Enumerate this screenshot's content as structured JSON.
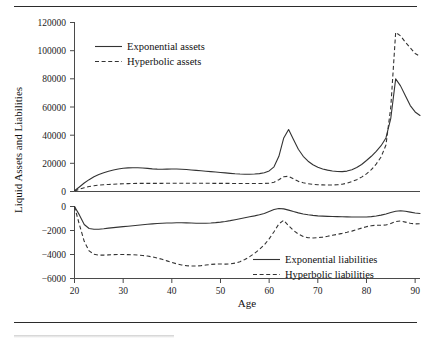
{
  "figure": {
    "has_top_rule": true,
    "has_bottom_rule": true,
    "background_color": "#ffffff",
    "line_color": "#333333"
  },
  "chart_data": {
    "type": "line",
    "title": "",
    "subtitle": "",
    "xlabel": "Age",
    "ylabel": "Liquid Assets and Liabilities",
    "grid": false,
    "panels": [
      {
        "name": "assets-panel",
        "ylim": [
          0,
          120000
        ],
        "yticks": [
          0,
          20000,
          40000,
          60000,
          80000,
          100000,
          120000
        ],
        "ytick_labels": [
          "0",
          "20000",
          "40000",
          "60000",
          "80000",
          "100000",
          "120000"
        ],
        "legend_position": "upper-left",
        "series": [
          {
            "name": "Exponential assets",
            "style": "solid",
            "x": [
              20,
              21,
              22,
              23,
              24,
              25,
              26,
              27,
              28,
              29,
              30,
              31,
              32,
              33,
              34,
              35,
              36,
              37,
              38,
              39,
              40,
              41,
              42,
              43,
              44,
              45,
              46,
              47,
              48,
              49,
              50,
              51,
              52,
              53,
              54,
              55,
              56,
              57,
              58,
              59,
              60,
              61,
              62,
              63,
              64,
              65,
              66,
              67,
              68,
              69,
              70,
              71,
              72,
              73,
              74,
              75,
              76,
              77,
              78,
              79,
              80,
              81,
              82,
              83,
              84,
              85,
              86,
              87,
              88,
              89,
              90,
              91
            ],
            "values": [
              500,
              3200,
              6000,
              8400,
              10400,
              12000,
              13300,
              14400,
              15300,
              16000,
              16500,
              16800,
              16900,
              16850,
              16700,
              16400,
              16100,
              15900,
              15800,
              15900,
              16000,
              15950,
              15800,
              15600,
              15300,
              15000,
              14700,
              14400,
              14100,
              13800,
              13500,
              13200,
              12900,
              12600,
              12400,
              12300,
              12300,
              12400,
              12700,
              13300,
              14600,
              17500,
              25000,
              38000,
              44000,
              37000,
              30000,
              25000,
              21500,
              19000,
              17200,
              16000,
              15200,
              14600,
              14200,
              14100,
              14500,
              15400,
              17000,
              19200,
              22000,
              25000,
              28500,
              32500,
              38000,
              52000,
              80000,
              75000,
              68000,
              61000,
              56500,
              54000
            ]
          },
          {
            "name": "Hyperbolic assets",
            "style": "dashed",
            "x": [
              20,
              21,
              22,
              23,
              24,
              25,
              26,
              27,
              28,
              29,
              30,
              31,
              32,
              33,
              34,
              35,
              36,
              37,
              38,
              39,
              40,
              41,
              42,
              43,
              44,
              45,
              46,
              47,
              48,
              49,
              50,
              51,
              52,
              53,
              54,
              55,
              56,
              57,
              58,
              59,
              60,
              61,
              62,
              63,
              64,
              65,
              66,
              67,
              68,
              69,
              70,
              71,
              72,
              73,
              74,
              75,
              76,
              77,
              78,
              79,
              80,
              81,
              82,
              83,
              84,
              85,
              86,
              87,
              88,
              89,
              90,
              91
            ],
            "values": [
              400,
              1600,
              2700,
              3500,
              4100,
              4500,
              4800,
              5000,
              5200,
              5350,
              5500,
              5600,
              5700,
              5750,
              5800,
              5800,
              5800,
              5800,
              5800,
              5850,
              5900,
              5900,
              5900,
              5900,
              5900,
              5900,
              5900,
              5850,
              5800,
              5800,
              5800,
              5800,
              5750,
              5700,
              5700,
              5700,
              5700,
              5700,
              5700,
              5750,
              5900,
              6600,
              8400,
              10500,
              10800,
              9000,
              7200,
              6200,
              5500,
              5100,
              4800,
              4700,
              4600,
              4600,
              4800,
              5200,
              5900,
              7000,
              8400,
              10200,
              12500,
              15500,
              19500,
              24500,
              33000,
              60000,
              113000,
              110500,
              106000,
              102000,
              98000,
              96000
            ]
          }
        ]
      },
      {
        "name": "liabilities-panel",
        "ylim": [
          -6000,
          0
        ],
        "yticks": [
          -6000,
          -4000,
          -2000,
          0
        ],
        "ytick_labels": [
          "−6000",
          "−4000",
          "−2000",
          "0"
        ],
        "legend_position": "lower-right",
        "series": [
          {
            "name": "Exponential liabilities",
            "style": "solid",
            "x": [
              20,
              21,
              22,
              23,
              24,
              25,
              26,
              27,
              28,
              29,
              30,
              31,
              32,
              33,
              34,
              35,
              36,
              37,
              38,
              39,
              40,
              41,
              42,
              43,
              44,
              45,
              46,
              47,
              48,
              49,
              50,
              51,
              52,
              53,
              54,
              55,
              56,
              57,
              58,
              59,
              60,
              61,
              62,
              63,
              64,
              65,
              66,
              67,
              68,
              69,
              70,
              71,
              72,
              73,
              74,
              75,
              76,
              77,
              78,
              79,
              80,
              81,
              82,
              83,
              84,
              85,
              86,
              87,
              88,
              89,
              90,
              91
            ],
            "values": [
              0,
              -700,
              -1500,
              -1830,
              -1900,
              -1890,
              -1850,
              -1800,
              -1760,
              -1720,
              -1680,
              -1640,
              -1600,
              -1560,
              -1520,
              -1480,
              -1450,
              -1420,
              -1400,
              -1380,
              -1370,
              -1360,
              -1360,
              -1365,
              -1375,
              -1390,
              -1400,
              -1390,
              -1370,
              -1340,
              -1300,
              -1250,
              -1180,
              -1100,
              -1020,
              -940,
              -860,
              -780,
              -690,
              -580,
              -420,
              -250,
              -170,
              -200,
              -300,
              -420,
              -530,
              -620,
              -690,
              -740,
              -780,
              -800,
              -820,
              -835,
              -845,
              -855,
              -865,
              -875,
              -880,
              -880,
              -870,
              -840,
              -790,
              -720,
              -620,
              -500,
              -390,
              -350,
              -400,
              -470,
              -540,
              -580
            ]
          },
          {
            "name": "Hyperbolic liabilities",
            "style": "dashed",
            "x": [
              20,
              21,
              22,
              23,
              24,
              25,
              26,
              27,
              28,
              29,
              30,
              31,
              32,
              33,
              34,
              35,
              36,
              37,
              38,
              39,
              40,
              41,
              42,
              43,
              44,
              45,
              46,
              47,
              48,
              49,
              50,
              51,
              52,
              53,
              54,
              55,
              56,
              57,
              58,
              59,
              60,
              61,
              62,
              63,
              64,
              65,
              66,
              67,
              68,
              69,
              70,
              71,
              72,
              73,
              74,
              75,
              76,
              77,
              78,
              79,
              80,
              81,
              82,
              83,
              84,
              85,
              86,
              87,
              88,
              89,
              90,
              91
            ],
            "values": [
              0,
              -1500,
              -2900,
              -3700,
              -3980,
              -4050,
              -4050,
              -4030,
              -4010,
              -4000,
              -4000,
              -4010,
              -4020,
              -4040,
              -4080,
              -4130,
              -4200,
              -4290,
              -4400,
              -4530,
              -4660,
              -4780,
              -4870,
              -4930,
              -4960,
              -4960,
              -4930,
              -4880,
              -4830,
              -4800,
              -4790,
              -4800,
              -4780,
              -4720,
              -4600,
              -4420,
              -4180,
              -3900,
              -3580,
              -3200,
              -2700,
              -2100,
              -1450,
              -1150,
              -1600,
              -2000,
              -2300,
              -2500,
              -2600,
              -2620,
              -2600,
              -2550,
              -2480,
              -2400,
              -2320,
              -2240,
              -2150,
              -2050,
              -1930,
              -1800,
              -1680,
              -1600,
              -1560,
              -1560,
              -1540,
              -1420,
              -1250,
              -1200,
              -1300,
              -1400,
              -1450,
              -1430
            ]
          }
        ]
      }
    ],
    "x": {
      "xlim": [
        20,
        91
      ],
      "xticks": [
        20,
        30,
        40,
        50,
        60,
        70,
        80,
        90
      ],
      "xtick_labels": [
        "20",
        "30",
        "40",
        "50",
        "60",
        "70",
        "80",
        "90"
      ]
    },
    "legend_entries": [
      {
        "label": "Exponential assets",
        "style": "solid",
        "panel": "assets-panel"
      },
      {
        "label": "Hyperbolic assets",
        "style": "dashed",
        "panel": "assets-panel"
      },
      {
        "label": "Exponential liabilities",
        "style": "solid",
        "panel": "liabilities-panel"
      },
      {
        "label": "Hyperbolic liabilities",
        "style": "dashed",
        "panel": "liabilities-panel"
      }
    ]
  }
}
